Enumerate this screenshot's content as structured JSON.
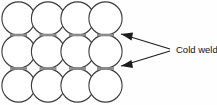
{
  "figure": {
    "background_color": "#fefefe",
    "width": 217,
    "height": 105
  },
  "callout": {
    "label": "Cold weld",
    "text_x": 176,
    "text_y": 50,
    "color": "#111111",
    "converge_x": 172,
    "converge_y": 50
  },
  "arrows": [
    {
      "name": "arrow-upper",
      "tip_x": 121,
      "tip_y": 34,
      "tail_x": 170,
      "tail_y": 49
    },
    {
      "name": "arrow-lower",
      "tip_x": 121,
      "tip_y": 66,
      "tail_x": 170,
      "tail_y": 51
    }
  ],
  "packing": {
    "rows": 3,
    "columns": 4,
    "radius": 16.6,
    "circle_stroke": "#3a3a3a",
    "circle_fill": "#ffffff",
    "weld_color": "#8a8a8a",
    "centers": [
      {
        "cx": 18.5,
        "cy": 18.5
      },
      {
        "cx": 48.0,
        "cy": 18.5
      },
      {
        "cx": 77.5,
        "cy": 18.5
      },
      {
        "cx": 105.5,
        "cy": 18.5
      },
      {
        "cx": 18.5,
        "cy": 51.5
      },
      {
        "cx": 48.0,
        "cy": 51.5
      },
      {
        "cx": 77.5,
        "cy": 51.5
      },
      {
        "cx": 105.5,
        "cy": 51.5
      },
      {
        "cx": 18.5,
        "cy": 85.5
      },
      {
        "cx": 48.0,
        "cy": 85.5
      },
      {
        "cx": 77.5,
        "cy": 85.5
      },
      {
        "cx": 105.5,
        "cy": 85.5
      }
    ],
    "weld_segments": [
      {
        "x1": 10.0,
        "y1": 35.0,
        "x2": 27.0,
        "y2": 35.0
      },
      {
        "x1": 39.5,
        "y1": 35.0,
        "x2": 56.5,
        "y2": 35.0
      },
      {
        "x1": 69.0,
        "y1": 35.0,
        "x2": 86.0,
        "y2": 35.0
      },
      {
        "x1": 97.0,
        "y1": 35.0,
        "x2": 114.0,
        "y2": 35.0
      },
      {
        "x1": 10.0,
        "y1": 68.5,
        "x2": 27.0,
        "y2": 68.5
      },
      {
        "x1": 39.5,
        "y1": 68.5,
        "x2": 56.5,
        "y2": 68.5
      },
      {
        "x1": 69.0,
        "y1": 68.5,
        "x2": 86.0,
        "y2": 68.5
      },
      {
        "x1": 97.0,
        "y1": 68.5,
        "x2": 114.0,
        "y2": 68.5
      }
    ]
  }
}
